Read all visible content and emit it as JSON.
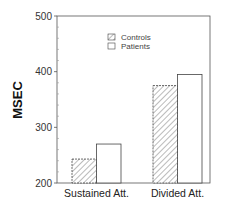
{
  "chart_data": {
    "type": "bar",
    "title": "",
    "xlabel": "",
    "ylabel": "MSEC",
    "ylim": [
      200,
      500
    ],
    "yticks": [
      200,
      300,
      400,
      500
    ],
    "minor_ticks_per_major": 5,
    "grid": false,
    "legend_position": "upper-center",
    "categories": [
      "Sustained Att.",
      "Divided Att."
    ],
    "series": [
      {
        "name": "Controls",
        "pattern": "hatched",
        "values": [
          243,
          375
        ]
      },
      {
        "name": "Patients",
        "pattern": "white",
        "values": [
          270,
          395
        ]
      }
    ]
  },
  "colors": {
    "axis": "#555555",
    "bar_stroke": "#444444",
    "hatch": "#777777",
    "fill_white": "#ffffff"
  }
}
